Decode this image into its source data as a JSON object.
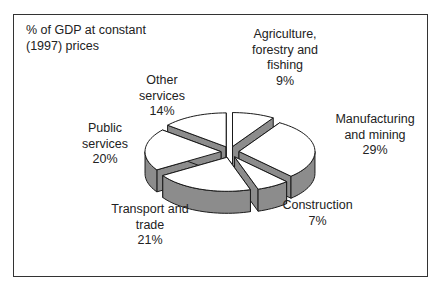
{
  "chart_data": {
    "type": "pie",
    "style": "3d-exploded",
    "title": "% of GDP at constant\n(1997) prices",
    "categories": [
      "Agriculture, forestry and fishing",
      "Manufacturing and mining",
      "Construction",
      "Transport and trade",
      "Public services",
      "Other services"
    ],
    "values": [
      9,
      29,
      7,
      21,
      20,
      14
    ],
    "unit": "%",
    "colors": {
      "top": "#ffffff",
      "side": "#8c8c8c",
      "outline": "#1a1a1a"
    }
  },
  "labels": {
    "title": "% of GDP at constant\n(1997) prices",
    "agriculture": "Agriculture,\nforestry and\nfishing\n9%",
    "manufacturing": "Manufacturing\nand mining\n29%",
    "construction": "Construction\n7%",
    "transport": "Transport and\ntrade\n21%",
    "public": "Public\nservices\n20%",
    "other": "Other\nservices\n14%"
  }
}
